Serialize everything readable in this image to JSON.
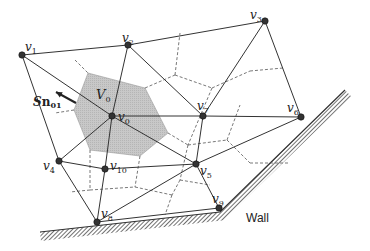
{
  "diagram": {
    "vertices": [
      {
        "id": "v0",
        "label": "v",
        "sub": "0",
        "x": 112,
        "y": 116,
        "lx": 118,
        "ly": 121
      },
      {
        "id": "v1",
        "label": "v",
        "sub": "1",
        "x": 22,
        "y": 55,
        "lx": 25,
        "ly": 51
      },
      {
        "id": "v2",
        "label": "v",
        "sub": "2",
        "x": 128,
        "y": 45,
        "lx": 122,
        "ly": 42
      },
      {
        "id": "v3",
        "label": "v",
        "sub": "3",
        "x": 265,
        "y": 21,
        "lx": 250,
        "ly": 19
      },
      {
        "id": "v4",
        "label": "v",
        "sub": "4",
        "x": 59,
        "y": 161,
        "lx": 43,
        "ly": 170
      },
      {
        "id": "v5",
        "label": "v",
        "sub": "5",
        "x": 196,
        "y": 164,
        "lx": 200,
        "ly": 175
      },
      {
        "id": "v6",
        "label": "v",
        "sub": "6",
        "x": 301,
        "y": 117,
        "lx": 287,
        "ly": 112
      },
      {
        "id": "v7",
        "label": "v",
        "sub": "7",
        "x": 203,
        "y": 116,
        "lx": 197,
        "ly": 110
      },
      {
        "id": "v8",
        "label": "v",
        "sub": "8",
        "x": 97,
        "y": 222,
        "lx": 101,
        "ly": 218
      },
      {
        "id": "v9",
        "label": "v",
        "sub": "9",
        "x": 219,
        "y": 208,
        "lx": 212,
        "ly": 203
      },
      {
        "id": "v10",
        "label": "v",
        "sub": "10",
        "x": 105,
        "y": 169,
        "lx": 110,
        "ly": 170
      }
    ],
    "edges": [
      [
        "v1",
        "v2"
      ],
      [
        "v2",
        "v3"
      ],
      [
        "v3",
        "v6"
      ],
      [
        "v1",
        "v4"
      ],
      [
        "v4",
        "v8"
      ],
      [
        "v8",
        "v9"
      ],
      [
        "v9",
        "v5"
      ],
      [
        "v1",
        "v0"
      ],
      [
        "v2",
        "v0"
      ],
      [
        "v0",
        "v7"
      ],
      [
        "v7",
        "v6"
      ],
      [
        "v0",
        "v4"
      ],
      [
        "v0",
        "v10"
      ],
      [
        "v0",
        "v5"
      ],
      [
        "v2",
        "v7"
      ],
      [
        "v3",
        "v7"
      ],
      [
        "v7",
        "v5"
      ],
      [
        "v5",
        "v6"
      ],
      [
        "v4",
        "v10"
      ],
      [
        "v10",
        "v5"
      ],
      [
        "v10",
        "v8"
      ],
      [
        "v8",
        "v5"
      ]
    ],
    "control_volume": {
      "label": "V",
      "sub": "0",
      "points": [
        [
          88,
          73
        ],
        [
          145,
          88
        ],
        [
          168,
          133
        ],
        [
          140,
          156
        ],
        [
          90,
          150
        ],
        [
          74,
          110
        ]
      ],
      "fill": "#c8c8c8"
    },
    "dual_edges_dashed": [
      [
        [
          75,
          60
        ],
        [
          88,
          73
        ]
      ],
      [
        [
          74,
          110
        ],
        [
          55,
          113
        ]
      ],
      [
        [
          145,
          88
        ],
        [
          175,
          75
        ]
      ],
      [
        [
          175,
          75
        ],
        [
          180,
          33
        ]
      ],
      [
        [
          175,
          75
        ],
        [
          212,
          88
        ]
      ],
      [
        [
          212,
          88
        ],
        [
          250,
          71
        ]
      ],
      [
        [
          250,
          71
        ],
        [
          283,
          68
        ]
      ],
      [
        [
          212,
          88
        ],
        [
          188,
          145
        ]
      ],
      [
        [
          168,
          133
        ],
        [
          188,
          145
        ]
      ],
      [
        [
          188,
          145
        ],
        [
          227,
          140
        ]
      ],
      [
        [
          227,
          140
        ],
        [
          250,
          163
        ]
      ],
      [
        [
          250,
          163
        ],
        [
          290,
          163
        ]
      ],
      [
        [
          227,
          140
        ],
        [
          240,
          105
        ]
      ],
      [
        [
          90,
          150
        ],
        [
          90,
          190
        ]
      ],
      [
        [
          140,
          156
        ],
        [
          135,
          187
        ]
      ],
      [
        [
          90,
          190
        ],
        [
          70,
          192
        ]
      ],
      [
        [
          90,
          190
        ],
        [
          135,
          187
        ]
      ],
      [
        [
          135,
          187
        ],
        [
          172,
          195
        ]
      ],
      [
        [
          172,
          195
        ],
        [
          165,
          215
        ]
      ],
      [
        [
          188,
          145
        ],
        [
          180,
          180
        ]
      ],
      [
        [
          180,
          180
        ],
        [
          172,
          195
        ]
      ],
      [
        [
          180,
          180
        ],
        [
          210,
          185
        ]
      ]
    ],
    "normal_vector": {
      "label": "Sn",
      "sub": "01",
      "from": [
        76,
        103
      ],
      "to": [
        56,
        92
      ]
    },
    "wall": {
      "label": "Wall",
      "points": [
        [
          40,
          232
        ],
        [
          220,
          212
        ],
        [
          345,
          90
        ]
      ],
      "label_x": 246,
      "label_y": 222
    },
    "colors": {
      "edge": "#333333",
      "dashed": "#555555",
      "node": "#333333",
      "hatch": "#333333"
    }
  }
}
